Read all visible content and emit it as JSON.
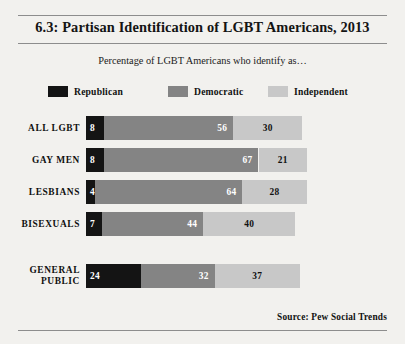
{
  "title": "6.3: Partisan Identification of LGBT Americans, 2013",
  "subtitle": "Percentage of LGBT Americans who identify as…",
  "source": "Source:  Pew Social Trends",
  "colors": {
    "republican": "#141414",
    "democratic": "#848484",
    "independent": "#c8c8c8",
    "background": "#f2f1ee",
    "rule": "#8d8d8d"
  },
  "legend": [
    {
      "label": "Republican",
      "color": "#141414"
    },
    {
      "label": "Democratic",
      "color": "#848484"
    },
    {
      "label": "Independent",
      "color": "#c8c8c8"
    }
  ],
  "chart_data": {
    "type": "bar",
    "title": "6.3: Partisan Identification of LGBT Americans, 2013",
    "subtitle": "Percentage of LGBT Americans who identify as…",
    "orientation": "horizontal",
    "stacked": true,
    "xlabel": "",
    "ylabel": "",
    "xlim": [
      0,
      100
    ],
    "grid": false,
    "legend_position": "top",
    "categories": [
      "ALL LGBT",
      "GAY MEN",
      "LESBIANS",
      "BISEXUALS",
      "GENERAL PUBLIC"
    ],
    "series": [
      {
        "name": "Republican",
        "values": [
          8,
          8,
          4,
          7,
          24
        ]
      },
      {
        "name": "Democratic",
        "values": [
          56,
          67,
          64,
          44,
          32
        ]
      },
      {
        "name": "Independent",
        "values": [
          30,
          21,
          28,
          40,
          37
        ]
      }
    ],
    "source": "Source:  Pew Social Trends"
  },
  "rows": [
    {
      "label_line1": "ALL LGBT",
      "label_line2": "",
      "republican": 8,
      "democratic": 56,
      "independent": 30,
      "top": 8
    },
    {
      "label_line1": "GAY MEN",
      "label_line2": "",
      "republican": 8,
      "democratic": 67,
      "independent": 21,
      "top": 40
    },
    {
      "label_line1": "LESBIANS",
      "label_line2": "",
      "republican": 4,
      "democratic": 64,
      "independent": 28,
      "top": 72
    },
    {
      "label_line1": "BISEXUALS",
      "label_line2": "",
      "republican": 7,
      "democratic": 44,
      "independent": 40,
      "top": 104
    },
    {
      "label_line1": "GENERAL",
      "label_line2": "PUBLIC",
      "republican": 24,
      "democratic": 32,
      "independent": 37,
      "top": 156
    }
  ]
}
